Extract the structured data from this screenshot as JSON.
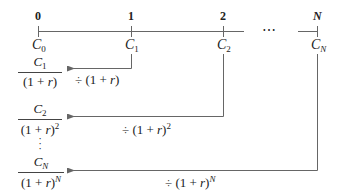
{
  "timeline": {
    "periods": [
      "0",
      "1",
      "2",
      "N"
    ],
    "ellipsis": "⋯",
    "cashflows": [
      {
        "base": "C",
        "sub": "0"
      },
      {
        "base": "C",
        "sub": "1"
      },
      {
        "base": "C",
        "sub": "2"
      },
      {
        "base": "C",
        "sub": "N"
      }
    ]
  },
  "discounted": [
    {
      "num_base": "C",
      "num_sub": "1",
      "den": "(1 + ",
      "den_var": "r",
      "den_close": ")",
      "den_exp": "",
      "op": "÷ (1 + ",
      "op_var": "r",
      "op_close": ")",
      "op_exp": ""
    },
    {
      "num_base": "C",
      "num_sub": "2",
      "den": "(1 + ",
      "den_var": "r",
      "den_close": ")",
      "den_exp": "2",
      "op": "÷ (1 + ",
      "op_var": "r",
      "op_close": ")",
      "op_exp": "2"
    },
    {
      "num_base": "C",
      "num_sub": "N",
      "den": "(1 + ",
      "den_var": "r",
      "den_close": ")",
      "den_exp": "N",
      "op": "÷ (1 + ",
      "op_var": "r",
      "op_close": ")",
      "op_exp": "N"
    }
  ],
  "vdots": "⋮",
  "colors": {
    "line": "#555555",
    "text": "#222222"
  }
}
